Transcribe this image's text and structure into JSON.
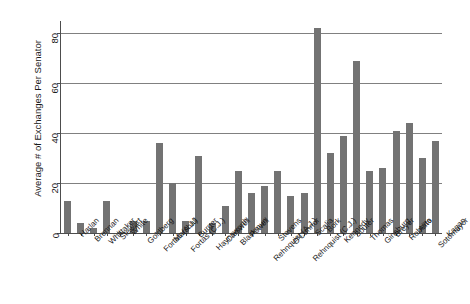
{
  "chart_data": {
    "type": "bar",
    "title": "",
    "xlabel": "",
    "ylabel": "Average # of Exchanges Per Senator",
    "ylim": [
      0,
      85
    ],
    "yticks": [
      0,
      20,
      40,
      60,
      80
    ],
    "ytick_labels": [
      "0",
      "20",
      "40",
      "60",
      "80"
    ],
    "grid": "horizontal",
    "legend": "none",
    "bar_color": "#737373",
    "categories": [
      "Harlan",
      "Brennan",
      "Whittaker",
      "Stewart",
      "White",
      "Goldberg",
      "Fortas (A.J.)",
      "Marshall",
      "Fortas (C.J.)",
      "Burger",
      "Haynsworth",
      "Carswell",
      "Blackmun",
      "Powell",
      "Rehnquist (A.J.)",
      "Stevens",
      "O'Connor",
      "Rehnquist (C.J.)",
      "Scalia",
      "Bork",
      "Kennedy",
      "Souter",
      "Thomas",
      "Ginsburg",
      "Breyer",
      "Roberts",
      "Alito",
      "Sotomayor",
      "Kagan"
    ],
    "values": [
      13,
      4,
      2,
      13,
      0.5,
      5,
      5,
      36,
      20,
      5,
      31,
      4,
      11,
      25,
      16,
      19,
      25,
      15,
      16,
      82,
      32,
      39,
      69,
      25,
      26,
      41,
      44,
      30,
      37
    ]
  },
  "axes": {
    "y_title": "Average # of Exchanges Per Senator"
  }
}
